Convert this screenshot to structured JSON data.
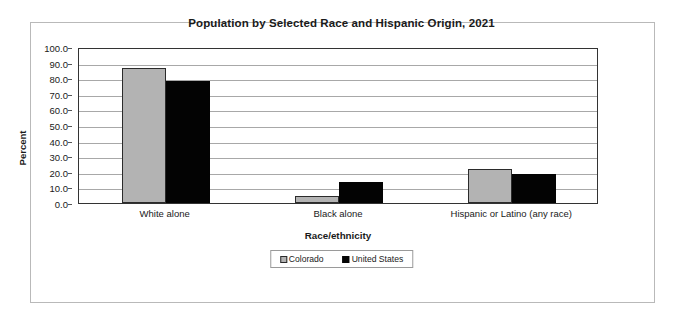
{
  "chart_data": {
    "type": "bar",
    "title": "Population by Selected Race and Hispanic Origin, 2021",
    "xlabel": "Race/ethnicity",
    "ylabel": "Percent",
    "categories": [
      "White alone",
      "Black alone",
      "Hispanic or Latino (any race)"
    ],
    "series": [
      {
        "name": "Colorado",
        "color": "#b3b3b3",
        "values": [
          86.5,
          4.7,
          22.0
        ]
      },
      {
        "name": "United States",
        "color": "#050505",
        "values": [
          78.5,
          13.6,
          18.9
        ]
      }
    ],
    "ylim": [
      0.0,
      100.0
    ],
    "ytick_step": 10.0,
    "ytick_labels": [
      "100.0",
      "90.0",
      "80.0",
      "70.0",
      "60.0",
      "50.0",
      "40.0",
      "30.0",
      "20.0",
      "10.0",
      "0.0"
    ],
    "grid": true,
    "legend_position": "bottom"
  }
}
